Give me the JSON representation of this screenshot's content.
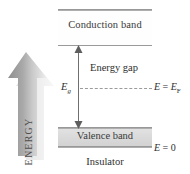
{
  "figure": {
    "caption": "Insulator",
    "bands": {
      "conduction": {
        "label": "Conduction band"
      },
      "valence": {
        "label": "Valence band"
      }
    },
    "gap": {
      "label": "Energy gap",
      "symbol": "E",
      "symbol_subscript": "g"
    },
    "levels": [
      {
        "name": "fermi-level",
        "text": "E = E",
        "subscript": "F"
      },
      {
        "name": "zero-level",
        "text": "E = 0",
        "subscript": ""
      }
    ],
    "fermi": {
      "lhs": "E",
      "eq": " = ",
      "rhs": "E",
      "rhs_sub": "F"
    },
    "zero": {
      "lhs": "E",
      "eq": " = ",
      "rhs": "0"
    },
    "axis": {
      "label": "ENERGY",
      "direction": "up"
    },
    "colors": {
      "valence_fill": "#d8d8d8",
      "conduction_fill": "#fefefe",
      "line": "#9a9a9a",
      "arrow_gray": "#a6a6a6",
      "text": "#2f2f2f"
    }
  }
}
